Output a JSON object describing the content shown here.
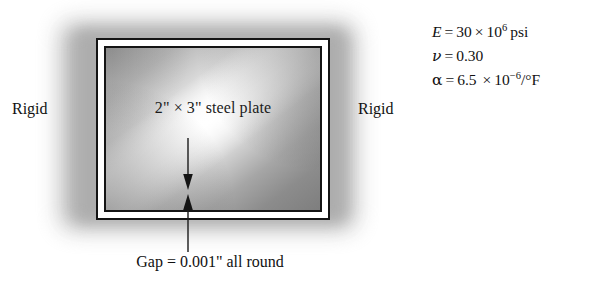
{
  "diagram": {
    "plate_label": "2\" × 3\" steel plate",
    "rigid_left": "Rigid",
    "rigid_right": "Rigid",
    "gap_caption": "Gap = 0.001\" all round",
    "arrow_up_name": "gap-arrow-up",
    "arrow_down_name": "gap-arrow-down"
  },
  "properties": {
    "youngs_modulus": {
      "symbol": "E",
      "equals": "=",
      "mantissa": "30",
      "times": "×",
      "base": "10",
      "exponent": "6",
      "units": "psi",
      "full_text": "E = 30 × 10^6 psi"
    },
    "poisson_ratio": {
      "symbol": "ν",
      "equals": "=",
      "value": "0.30",
      "full_text": "ν = 0.30"
    },
    "thermal_expansion": {
      "symbol": "α",
      "equals": "=",
      "mantissa": "6.5",
      "times": "×",
      "base": "10",
      "exponent": "−6",
      "units": "/°F",
      "full_text": "α = 6.5 × 10^-6 /°F"
    }
  },
  "colors": {
    "ink": "#111111",
    "frame_line": "#141414",
    "halo_gray": "#b9b9b9",
    "plate_dark": "#7e7e7e",
    "plate_light": "#ffffff",
    "gap_white": "#ffffff",
    "background": "#ffffff"
  }
}
